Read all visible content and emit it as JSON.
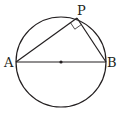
{
  "diagram": {
    "type": "geometry",
    "labels": {
      "A": "A",
      "B": "B",
      "P": "P"
    },
    "colors": {
      "stroke": "#231f20",
      "background": "#ffffff"
    }
  }
}
